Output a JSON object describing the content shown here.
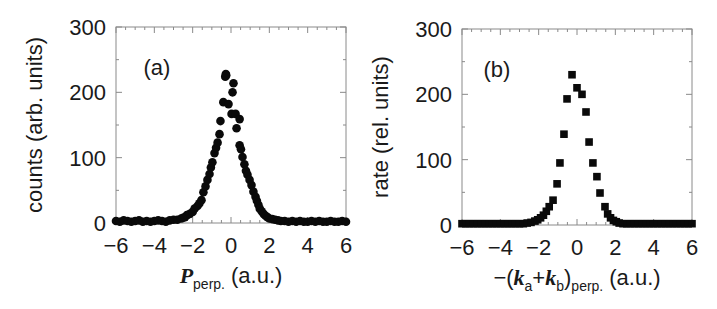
{
  "chart_data": [
    {
      "type": "scatter",
      "panel_label": "(a)",
      "title": "",
      "xlabel": "P_perp. (a.u.)",
      "xlabel_main": "P",
      "xlabel_sub": "perp.",
      "xlabel_unit": "(a.u.)",
      "ylabel": "counts (arb. units)",
      "xlim": [
        -6,
        6
      ],
      "ylim": [
        0,
        300
      ],
      "xticks": [
        "−6",
        "−4",
        "−2",
        "0",
        "2",
        "4",
        "6"
      ],
      "yticks": [
        "0",
        "100",
        "200",
        "300"
      ],
      "marker": "circle",
      "grid": false,
      "x": [
        -6.0,
        -5.8,
        -5.6,
        -5.4,
        -5.2,
        -5.0,
        -4.8,
        -4.6,
        -4.4,
        -4.2,
        -4.0,
        -3.8,
        -3.6,
        -3.4,
        -3.2,
        -3.0,
        -2.8,
        -2.6,
        -2.5,
        -2.4,
        -2.3,
        -2.15,
        -2.0,
        -1.9,
        -1.75,
        -1.65,
        -1.54,
        -1.44,
        -1.33,
        -1.23,
        -1.12,
        -1.05,
        -0.97,
        -0.86,
        -0.78,
        -0.7,
        -0.6,
        -0.55,
        -0.4,
        -0.3,
        -0.27,
        -0.25,
        -0.13,
        0.03,
        0.08,
        0.13,
        0.24,
        0.29,
        0.45,
        0.45,
        0.52,
        0.6,
        0.7,
        0.78,
        0.86,
        0.97,
        1.07,
        1.17,
        1.28,
        1.35,
        1.43,
        1.5,
        1.6,
        1.7,
        1.8,
        1.9,
        2.0,
        2.15,
        2.3,
        2.45,
        2.6,
        2.8,
        3.0,
        3.2,
        3.4,
        3.6,
        3.8,
        4.0,
        4.2,
        4.4,
        4.6,
        4.8,
        5.0,
        5.2,
        5.4,
        5.6,
        5.8,
        6.0
      ],
      "y": [
        3,
        2,
        4,
        3,
        2,
        3,
        4,
        2,
        3,
        2,
        3,
        4,
        3,
        2,
        4,
        5,
        5,
        7,
        8,
        9,
        12,
        14,
        17,
        22,
        26,
        30,
        35,
        47,
        56,
        66,
        75,
        85,
        93,
        107,
        115,
        123,
        136,
        156,
        185,
        224,
        228,
        226,
        182,
        167,
        200,
        214,
        167,
        145,
        159,
        119,
        113,
        101,
        90,
        80,
        74,
        66,
        58,
        48,
        40,
        34,
        28,
        22,
        18,
        14,
        11,
        9,
        7,
        6,
        5,
        4,
        3,
        3,
        2,
        3,
        2,
        3,
        2,
        2,
        3,
        2,
        3,
        2,
        2,
        3,
        2,
        2,
        3,
        2
      ]
    },
    {
      "type": "scatter",
      "panel_label": "(b)",
      "title": "",
      "xlabel": "−(k_a+k_b)_perp. (a.u.)",
      "xlabel_prefix": "−(",
      "xlabel_k": "k",
      "xlabel_sub_a": "a",
      "xlabel_plus": "+",
      "xlabel_sub_b": "b",
      "xlabel_close": ")",
      "xlabel_sub_perp": "perp.",
      "xlabel_unit": "(a.u.)",
      "ylabel": "rate (rel. units)",
      "xlim": [
        -6,
        6
      ],
      "ylim": [
        0,
        300
      ],
      "xticks": [
        "−6",
        "−4",
        "−2",
        "0",
        "2",
        "4",
        "6"
      ],
      "yticks": [
        "0",
        "100",
        "200",
        "300"
      ],
      "marker": "square",
      "grid": false,
      "x": [
        -6.0,
        -5.8,
        -5.6,
        -5.4,
        -5.2,
        -5.0,
        -4.8,
        -4.6,
        -4.4,
        -4.2,
        -4.0,
        -3.8,
        -3.6,
        -3.4,
        -3.2,
        -3.0,
        -2.8,
        -2.6,
        -2.4,
        -2.2,
        -2.05,
        -1.9,
        -1.75,
        -1.6,
        -1.45,
        -1.25,
        -1.04,
        -0.89,
        -0.68,
        -0.52,
        -0.26,
        0.0,
        0.26,
        0.47,
        0.63,
        0.83,
        1.04,
        1.2,
        1.46,
        1.6,
        1.75,
        1.9,
        2.05,
        2.2,
        2.4,
        2.6,
        2.8,
        3.0,
        3.2,
        3.4,
        3.6,
        3.8,
        4.0,
        4.2,
        4.4,
        4.6,
        4.8,
        5.0,
        5.2,
        5.4,
        5.6,
        5.8,
        6.0
      ],
      "y": [
        2,
        2,
        2,
        2,
        2,
        2,
        2,
        2,
        2,
        2,
        2,
        2,
        2,
        2,
        2,
        2,
        2,
        3,
        4,
        6,
        8,
        11,
        15,
        21,
        28,
        38,
        63,
        95,
        139,
        193,
        230,
        210,
        200,
        173,
        127,
        95,
        74,
        49,
        28,
        17,
        11,
        7,
        5,
        3,
        2,
        2,
        2,
        2,
        2,
        2,
        2,
        2,
        2,
        2,
        2,
        2,
        2,
        2,
        2,
        2,
        2,
        2,
        2
      ]
    }
  ],
  "colors": {
    "marker": "#0a0a0a",
    "frame": "#8a8a8a",
    "text": "#1a1a1a",
    "background": "#ffffff"
  }
}
